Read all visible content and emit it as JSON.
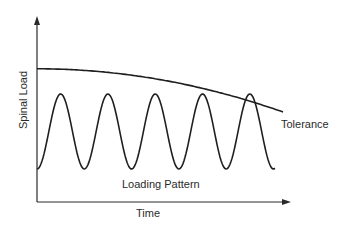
{
  "chart_data": {
    "type": "line",
    "title": "",
    "xlabel": "Time",
    "ylabel": "Spinal Load",
    "grid": false,
    "series": [
      {
        "name": "Tolerance",
        "description": "slowly declining curve over time",
        "x": [
          0,
          0.25,
          0.5,
          0.75,
          1.0
        ],
        "y": [
          0.74,
          0.72,
          0.68,
          0.6,
          0.5
        ]
      },
      {
        "name": "Loading Pattern",
        "description": "periodic oscillation with 5 peaks; last peak touches tolerance",
        "peaks": 5,
        "min": 0.18,
        "max": 0.6
      }
    ],
    "annotations": [
      "Tolerance",
      "Loading Pattern"
    ]
  }
}
